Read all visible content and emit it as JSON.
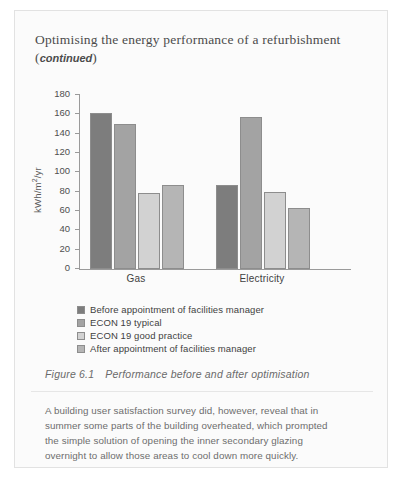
{
  "page": {
    "heading_main": "Optimising the energy performance of a refurbishment",
    "heading_continued": "continued",
    "heading_open_paren": "(",
    "heading_close_paren": ")"
  },
  "figure": {
    "caption_number": "Figure 6.1",
    "caption_text": "Performance before and after optimisation"
  },
  "chart_data": {
    "type": "bar",
    "title": "",
    "xlabel": "",
    "ylabel": "kWh/m2/yr",
    "ylabel_unit_base": "kWh/m",
    "ylabel_unit_sup": "2",
    "ylabel_unit_tail": "/yr",
    "categories": [
      "Gas",
      "Electricity"
    ],
    "series": [
      {
        "name": "Before appointment of facilities manager",
        "values": [
          161,
          87
        ],
        "color": "#7d7d7d"
      },
      {
        "name": "ECON 19 typical",
        "values": [
          150,
          157
        ],
        "color": "#a3a3a3"
      },
      {
        "name": "ECON 19 good practice",
        "values": [
          79,
          80
        ],
        "color": "#d2d2d2"
      },
      {
        "name": "After appointment of facilities manager",
        "values": [
          87,
          63
        ],
        "color": "#b5b5b5"
      }
    ],
    "ylim": [
      0,
      180
    ],
    "yticks": [
      0,
      20,
      40,
      60,
      80,
      100,
      120,
      140,
      160,
      180
    ],
    "grid": false,
    "legend_position": "bottom-left"
  },
  "body": {
    "lines": [
      "A building user satisfaction survey did, however, reveal that in",
      "summer some parts of the building overheated, which prompted",
      "the simple solution of opening the inner secondary glazing",
      "overnight to allow those areas to cool down more quickly."
    ]
  }
}
